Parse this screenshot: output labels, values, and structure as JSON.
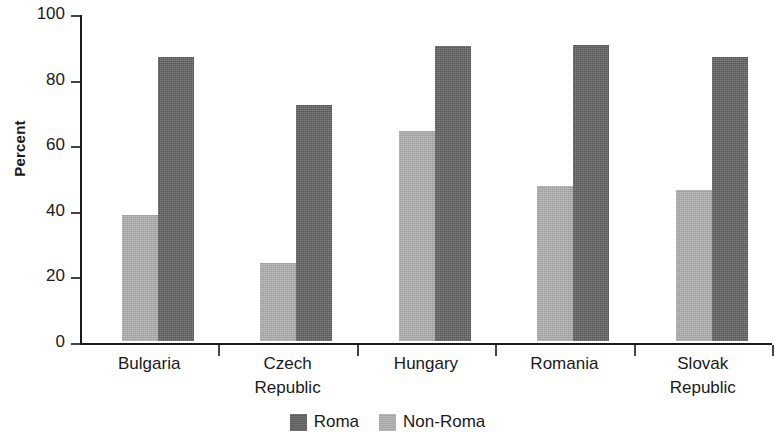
{
  "chart_data": {
    "type": "bar",
    "title": "",
    "subtitle": "",
    "xlabel": "",
    "ylabel": "Percent",
    "ylim": [
      0,
      100
    ],
    "yticks": [
      0,
      20,
      40,
      60,
      80,
      100
    ],
    "ytick_labels": [
      "0",
      "20",
      "40",
      "60",
      "80",
      "100"
    ],
    "grid": false,
    "legend_position": "bottom-center",
    "categories": [
      "Bulgaria",
      "Czech Republic",
      "Hungary",
      "Romania",
      "Slovak Republic"
    ],
    "category_lines": [
      [
        "Bulgaria"
      ],
      [
        "Czech",
        "Republic"
      ],
      [
        "Hungary"
      ],
      [
        "Romania"
      ],
      [
        "Slovak",
        "Republic"
      ]
    ],
    "series": [
      {
        "name": "Roma",
        "color": "#636363",
        "values": [
          86.5,
          72.0,
          90.0,
          90.3,
          86.5
        ]
      },
      {
        "name": "Non-Roma",
        "color": "#b0b0b0",
        "values": [
          38.5,
          23.8,
          64.0,
          47.3,
          46.0
        ]
      }
    ],
    "bar_order_in_group": [
      "Non-Roma",
      "Roma"
    ],
    "annotations": []
  },
  "legend": {
    "items": [
      {
        "label": "Roma",
        "color": "#636363",
        "swatch_name": "legend-swatch-roma"
      },
      {
        "label": "Non-Roma",
        "color": "#b0b0b0",
        "swatch_name": "legend-swatch-non-roma"
      }
    ]
  },
  "colors": {
    "roma": "#636363",
    "non_roma": "#b0b0b0",
    "axis": "#1a1a1a",
    "background": "#ffffff"
  }
}
